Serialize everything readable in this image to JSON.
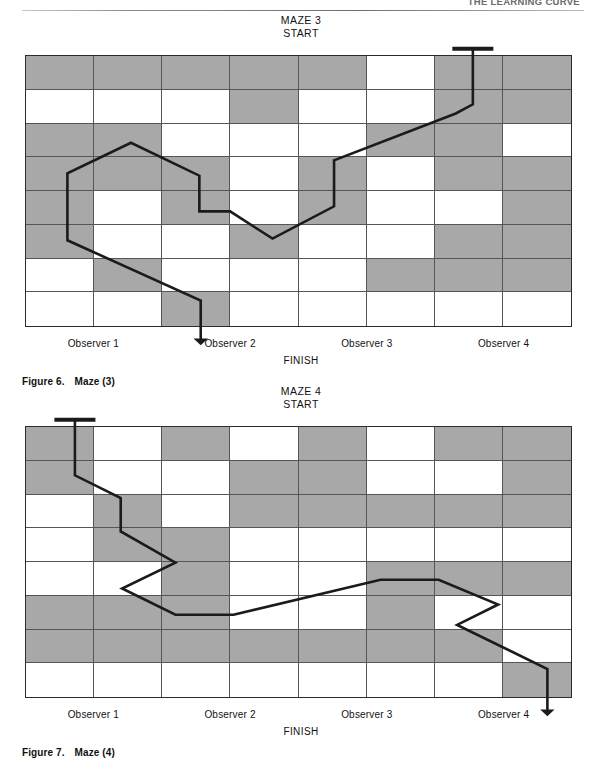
{
  "page": {
    "running_header": "THE LEARNING CURVE"
  },
  "figures": [
    {
      "id": "maze-3",
      "maze_title": "MAZE 3\nSTART",
      "finish_label": "FINISH",
      "caption_number": "Figure 6.",
      "caption_text": "Maze (3)",
      "observers": [
        "Observer 1",
        "Observer 2",
        "Observer 3",
        "Observer 4"
      ],
      "grid": {
        "columns": 8,
        "rows": 8,
        "shaded_color": "#a8a8a8",
        "plain_color": "#ffffff",
        "pattern": [
          [
            1,
            1,
            1,
            1,
            1,
            0,
            1,
            1
          ],
          [
            0,
            0,
            0,
            1,
            0,
            0,
            1,
            1
          ],
          [
            1,
            1,
            0,
            0,
            0,
            1,
            1,
            0
          ],
          [
            1,
            1,
            1,
            0,
            1,
            0,
            1,
            1
          ],
          [
            1,
            0,
            1,
            0,
            1,
            0,
            0,
            1
          ],
          [
            1,
            0,
            0,
            1,
            0,
            0,
            1,
            1
          ],
          [
            0,
            1,
            0,
            0,
            0,
            1,
            1,
            1
          ],
          [
            0,
            0,
            1,
            0,
            0,
            0,
            0,
            0
          ]
        ]
      },
      "path": {
        "stroke_color": "#1b1b1b",
        "start_marker": {
          "x": 6.55,
          "y": 0
        },
        "end_marker": {
          "x": 2.57,
          "y": 8
        },
        "points": [
          [
            6.55,
            0.0
          ],
          [
            6.55,
            1.45
          ],
          [
            6.3,
            1.72
          ],
          [
            4.52,
            3.1
          ],
          [
            4.52,
            4.45
          ],
          [
            3.62,
            5.4
          ],
          [
            3.0,
            4.6
          ],
          [
            2.55,
            4.6
          ],
          [
            2.55,
            3.55
          ],
          [
            1.55,
            2.58
          ],
          [
            0.62,
            3.48
          ],
          [
            0.62,
            5.45
          ],
          [
            2.57,
            7.22
          ],
          [
            2.57,
            8.0
          ]
        ]
      }
    },
    {
      "id": "maze-4",
      "maze_title": "MAZE 4\nSTART",
      "finish_label": "FINISH",
      "caption_number": "Figure 7.",
      "caption_text": "Maze (4)",
      "observers": [
        "Observer 1",
        "Observer 2",
        "Observer 3",
        "Observer 4"
      ],
      "grid": {
        "columns": 8,
        "rows": 8,
        "shaded_color": "#a8a8a8",
        "plain_color": "#ffffff",
        "pattern": [
          [
            1,
            0,
            1,
            0,
            1,
            0,
            1,
            1
          ],
          [
            1,
            0,
            0,
            1,
            1,
            0,
            0,
            1
          ],
          [
            0,
            1,
            0,
            1,
            1,
            1,
            1,
            1
          ],
          [
            0,
            1,
            1,
            0,
            0,
            0,
            0,
            0
          ],
          [
            0,
            0,
            1,
            0,
            0,
            1,
            1,
            1
          ],
          [
            1,
            1,
            1,
            0,
            0,
            1,
            0,
            0
          ],
          [
            1,
            1,
            1,
            1,
            1,
            1,
            1,
            0
          ],
          [
            0,
            0,
            0,
            0,
            0,
            0,
            0,
            1
          ]
        ]
      },
      "path": {
        "stroke_color": "#1b1b1b",
        "start_marker": {
          "x": 0.73,
          "y": 0
        },
        "end_marker": {
          "x": 7.64,
          "y": 8
        },
        "points": [
          [
            0.73,
            0.0
          ],
          [
            0.73,
            1.45
          ],
          [
            1.4,
            2.12
          ],
          [
            1.4,
            3.1
          ],
          [
            2.2,
            4.02
          ],
          [
            1.42,
            4.78
          ],
          [
            2.2,
            5.55
          ],
          [
            3.05,
            5.55
          ],
          [
            5.2,
            4.52
          ],
          [
            6.05,
            4.52
          ],
          [
            6.92,
            5.25
          ],
          [
            6.32,
            5.85
          ],
          [
            7.64,
            7.15
          ],
          [
            7.64,
            8.0
          ]
        ]
      }
    }
  ]
}
